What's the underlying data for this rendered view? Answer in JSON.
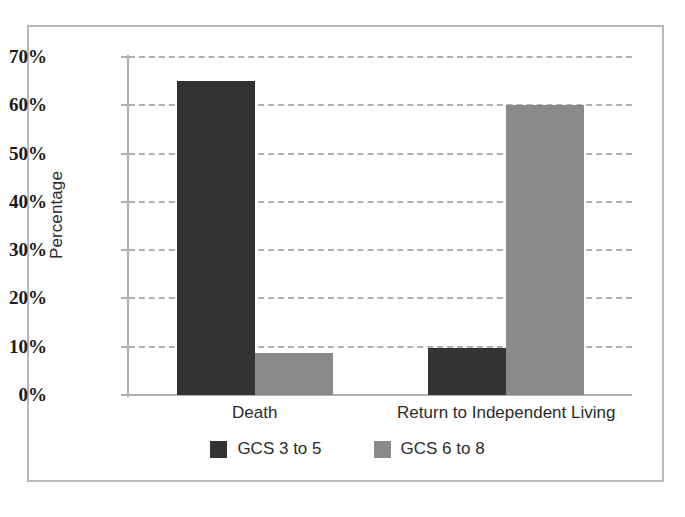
{
  "chart_data": {
    "type": "bar",
    "title": "",
    "subtitle": "",
    "xlabel": "",
    "ylabel": "Percentage",
    "categories": [
      "Death",
      "Return to Independent Living"
    ],
    "series": [
      {
        "name": "GCS 3 to 5",
        "color": "#333333",
        "values": [
          65,
          9.7
        ]
      },
      {
        "name": "GCS 6 to 8",
        "color": "#8a8a8a",
        "values": [
          8.7,
          60
        ]
      }
    ],
    "ylim": [
      0,
      70
    ],
    "ytick_values": [
      70,
      60,
      50,
      40,
      30,
      20,
      10,
      0
    ],
    "ytick_labels": [
      "70%",
      "60%",
      "50%",
      "40%",
      "30%",
      "20%",
      "10%",
      "0%"
    ],
    "grid": true,
    "grid_style": "dashed-horizontal",
    "legend_position": "bottom-center",
    "frame": true
  }
}
